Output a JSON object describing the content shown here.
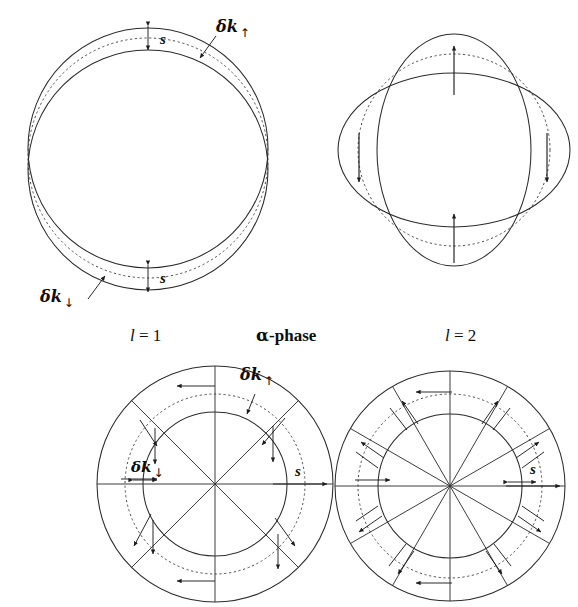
{
  "figure": {
    "domain": "scientific-diagram",
    "background_color": "#ffffff",
    "ink_color": "#2b2b2b"
  },
  "captions": {
    "left": {
      "symbol": "l",
      "relation": " = ",
      "value": "1"
    },
    "center": {
      "greek": "α",
      "text": "-phase"
    },
    "right": {
      "symbol": "l",
      "relation": " = ",
      "value": "2"
    }
  },
  "panels": {
    "top_left": {
      "name": "l = 1 displaced circles",
      "labels": {
        "dk_up": {
          "text": "δk",
          "arrow": "↑"
        },
        "dk_down": {
          "text": "δk",
          "arrow": "↓"
        },
        "s_top": "s",
        "s_bottom": "s"
      },
      "geometry": {
        "outer_cx": 148,
        "outer_cy": 148,
        "outer_r": 120,
        "dashed_cx": 148,
        "dashed_cy": 158,
        "dashed_r": 120,
        "inner_cx": 148,
        "inner_cy": 170,
        "inner_r": 120
      }
    },
    "top_right": {
      "name": "l = 2 crossed ellipses",
      "labels": {},
      "geometry": {
        "cx": 164,
        "cy": 150,
        "tall_rx": 77,
        "tall_ry": 116,
        "wide_rx": 116,
        "wide_ry": 77,
        "dashed_r": 96
      },
      "arrows": [
        {
          "position": "top",
          "direction": "up"
        },
        {
          "position": "left",
          "direction": "down"
        },
        {
          "position": "right",
          "direction": "down"
        },
        {
          "position": "bottom",
          "direction": "up"
        }
      ]
    },
    "bottom_left": {
      "name": "l = 1 polar annulus, 8 spokes",
      "labels": {
        "dk_up": {
          "text": "δk",
          "arrow": "↑"
        },
        "dk_down": {
          "text": "δk",
          "arrow": "↓"
        },
        "s": "s"
      },
      "geometry": {
        "cx": 120,
        "cy": 122,
        "outer_r": 118,
        "dashed_r": 90,
        "inner_r": 72,
        "spoke_count": 8,
        "spoke_step_deg": 45
      }
    },
    "bottom_right": {
      "name": "l = 2 polar annulus, 12 spokes",
      "labels": {
        "s": "s"
      },
      "geometry": {
        "cx": 120,
        "cy": 118,
        "outer_r": 115,
        "dashed_r": 92,
        "inner_r": 72,
        "spoke_count": 12,
        "spoke_step_deg": 30
      }
    }
  }
}
